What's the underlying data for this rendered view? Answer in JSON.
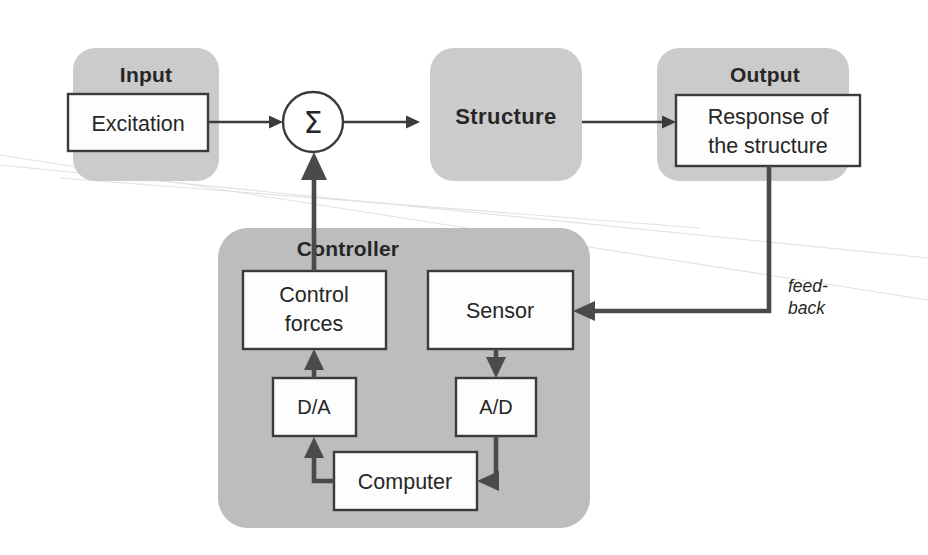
{
  "diagram": {
    "colors": {
      "panel_fill": "#cbcbcb",
      "controller_panel_fill": "#bdbdbd",
      "node_fill": "#fdfdfd",
      "stroke": "#3b3b3b",
      "thick_stroke": "#4a4a4a",
      "text": "#262626",
      "background": "#ffffff",
      "scan_artifact": "#e2e2e2"
    },
    "panels": [
      {
        "id": "input",
        "title": "Input"
      },
      {
        "id": "structure",
        "title": "Structure"
      },
      {
        "id": "output",
        "title": "Output"
      },
      {
        "id": "controller",
        "title": "Controller"
      }
    ],
    "nodes": [
      {
        "id": "excitation",
        "label": "Excitation"
      },
      {
        "id": "summation",
        "label": "Σ"
      },
      {
        "id": "response",
        "label_line1": "Response of",
        "label_line2": "the structure"
      },
      {
        "id": "control-forces",
        "label_line1": "Control",
        "label_line2": "forces"
      },
      {
        "id": "sensor",
        "label": "Sensor"
      },
      {
        "id": "da-converter",
        "label": "D/A"
      },
      {
        "id": "ad-converter",
        "label": "A/D"
      },
      {
        "id": "computer",
        "label": "Computer"
      }
    ],
    "edge_labels": {
      "feedback_line1": "feed-",
      "feedback_line2": "back"
    },
    "edges": [
      {
        "from": "excitation",
        "to": "summation"
      },
      {
        "from": "summation",
        "to": "structure"
      },
      {
        "from": "structure",
        "to": "response"
      },
      {
        "from": "response",
        "to": "sensor",
        "label": "feedback"
      },
      {
        "from": "sensor",
        "to": "ad-converter"
      },
      {
        "from": "ad-converter",
        "to": "computer"
      },
      {
        "from": "computer",
        "to": "da-converter"
      },
      {
        "from": "da-converter",
        "to": "control-forces"
      },
      {
        "from": "control-forces",
        "to": "summation"
      }
    ]
  }
}
